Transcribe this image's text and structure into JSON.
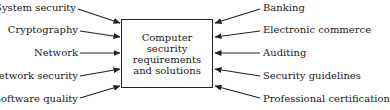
{
  "diagram": {
    "type": "hub-and-spoke",
    "center": {
      "lines": [
        "Computer security",
        "requirements",
        "and solutions"
      ]
    },
    "left_inputs": [
      {
        "label": "System security"
      },
      {
        "label": "Cryptography"
      },
      {
        "label": "Network"
      },
      {
        "label": "Network security"
      },
      {
        "label": "Software quality"
      }
    ],
    "right_inputs": [
      {
        "label": "Banking"
      },
      {
        "label": "Electronic commerce"
      },
      {
        "label": "Auditing"
      },
      {
        "label": "Security guidelines"
      },
      {
        "label": "Professional certification"
      }
    ],
    "arrow_color": "#222222",
    "text_color": "#1a1a1a"
  }
}
